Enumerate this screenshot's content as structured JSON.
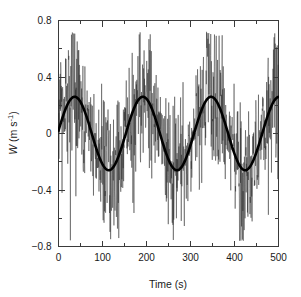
{
  "chart_data": {
    "type": "line",
    "title": "",
    "xlabel": "Time (s)",
    "ylabel": "W (m s-1)",
    "ylabel_symbol": "W",
    "ylabel_units": "(m s",
    "ylabel_exponent": "-1",
    "ylabel_units_close": ")",
    "xlim": [
      0,
      500
    ],
    "ylim": [
      -0.8,
      0.8
    ],
    "xticks": [
      0,
      100,
      200,
      300,
      400,
      500
    ],
    "xticklabels": [
      "0",
      "100",
      "200",
      "300",
      "400",
      "500"
    ],
    "xminorticks": [
      50,
      150,
      250,
      350,
      450
    ],
    "yticks": [
      0.8,
      0.4,
      0,
      -0.4,
      -0.8
    ],
    "yticklabels": [
      "0.8",
      "0.4",
      "0",
      "−0.4",
      "−0.8"
    ],
    "yminorticks": [
      0.6,
      0.2,
      -0.2,
      -0.6
    ],
    "grid": false,
    "legend": "none",
    "series": [
      {
        "name": "turbulent vertical velocity",
        "style": "thin-noisy-line",
        "color": "#2b2b2b",
        "description": "high-frequency turbulent fluctuations about the mean wave",
        "noise_amplitude": 0.3,
        "noise_max": 0.72,
        "noise_min": -0.76,
        "sample_interval_s": 0.5
      },
      {
        "name": "phase-averaged wave component",
        "style": "thick-smooth-sine",
        "color": "#000000",
        "amplitude": 0.26,
        "period_s": 155,
        "phase_offset_s": 0,
        "mean": 0.0,
        "peaks_at_s": [
          40,
          196,
          352
        ],
        "troughs_at_s": [
          118,
          274,
          430
        ],
        "value_at_0_s": 0.02,
        "value_at_500_s": 0.22
      }
    ]
  }
}
